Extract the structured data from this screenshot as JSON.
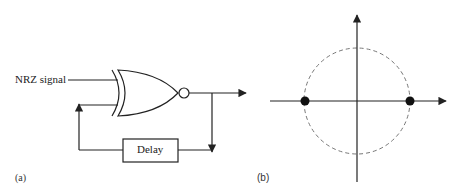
{
  "panel_a": {
    "label": "(a)",
    "input_label": "NRZ signal",
    "gate": "XNOR",
    "delay_label": "Delay"
  },
  "panel_b": {
    "label": "(b)",
    "constellation": {
      "points": [
        {
          "x": -1,
          "y": 0
        },
        {
          "x": 1,
          "y": 0
        }
      ],
      "circle": "dashed unit circle"
    }
  },
  "colors": {
    "line": "#222222",
    "circle": "#777777"
  }
}
